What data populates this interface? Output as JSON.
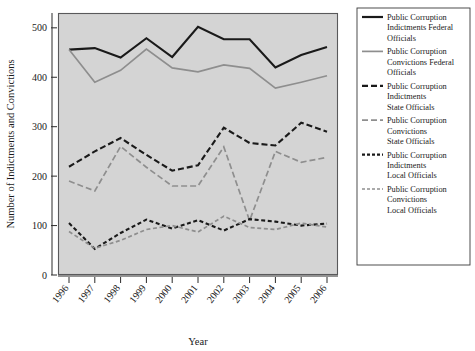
{
  "chart_data": {
    "type": "line",
    "title": "",
    "xlabel": "Year",
    "ylabel": "Number of Indictments and Convictions",
    "x": [
      1996,
      1997,
      1998,
      1999,
      2000,
      2001,
      2002,
      2003,
      2004,
      2005,
      2006
    ],
    "categories": [
      "1996",
      "1997",
      "1998",
      "1999",
      "2000",
      "2001",
      "2002",
      "2003",
      "2004",
      "2005",
      "2006"
    ],
    "xtick_labels": [
      "1996",
      "1997",
      "1998",
      "1999",
      "2000",
      "2001",
      "2002",
      "2003",
      "2004",
      "2005",
      "2006"
    ],
    "ytick_labels": [
      "0",
      "100",
      "200",
      "300",
      "400",
      "500"
    ],
    "yticks": [
      0,
      100,
      200,
      300,
      400,
      500
    ],
    "ylim": [
      0,
      530
    ],
    "xlim": [
      1995.6,
      2006.4
    ],
    "grid": false,
    "legend_position": "right",
    "plot_background": "#d4d4d4",
    "series": [
      {
        "name": "Public Corruption Indictments Federal Officials",
        "style": "solid",
        "color": "#1a1a1a",
        "width": 2.1,
        "dash": "none",
        "values": [
          456,
          459,
          440,
          479,
          441,
          502,
          477,
          477,
          420,
          445,
          461
        ]
      },
      {
        "name": "Public Corruption Convictions Federal Officials",
        "style": "solid",
        "color": "#8e8e8e",
        "width": 1.7,
        "dash": "none",
        "values": [
          456,
          390,
          414,
          457,
          419,
          411,
          425,
          418,
          378,
          390,
          403
        ]
      },
      {
        "name": "Public Corruption Indictments State Officials",
        "style": "dashed",
        "color": "#1a1a1a",
        "width": 2.1,
        "dash": "6,3",
        "values": [
          219,
          250,
          277,
          243,
          211,
          222,
          298,
          267,
          262,
          308,
          290
        ]
      },
      {
        "name": "Public Corruption Convictions State Officials",
        "style": "dashed",
        "color": "#8e8e8e",
        "width": 1.7,
        "dash": "6,3",
        "values": [
          190,
          170,
          260,
          218,
          180,
          180,
          259,
          110,
          250,
          228,
          238
        ]
      },
      {
        "name": "Public Corruption Indictments Local Officials",
        "style": "fine-dashed",
        "color": "#1a1a1a",
        "width": 2.1,
        "dash": "4,2.6",
        "values": [
          105,
          53,
          85,
          112,
          94,
          111,
          90,
          113,
          108,
          100,
          104
        ]
      },
      {
        "name": "Public Corruption Convictions Local Officials",
        "style": "fine-dashed",
        "color": "#8e8e8e",
        "width": 1.7,
        "dash": "4,2.6",
        "values": [
          88,
          54,
          70,
          92,
          100,
          87,
          119,
          96,
          92,
          105,
          97
        ]
      }
    ]
  },
  "legend": {
    "items": [
      {
        "label_lines": [
          "Public Corruption",
          "Indictments Federal",
          "Officials"
        ],
        "color": "#1a1a1a",
        "dash": "none",
        "width": 2.2
      },
      {
        "label_lines": [
          "Public Corruption",
          "Convictions Federal",
          "Officials"
        ],
        "color": "#8e8e8e",
        "dash": "none",
        "width": 1.7
      },
      {
        "label_lines": [
          "Public Corruption",
          "Indictments",
          "State Officials"
        ],
        "color": "#1a1a1a",
        "dash": "6,3",
        "width": 2.2
      },
      {
        "label_lines": [
          "Public Corruption",
          "Convictions",
          "State Officials"
        ],
        "color": "#8e8e8e",
        "dash": "6,3",
        "width": 1.7
      },
      {
        "label_lines": [
          "Public Corruption",
          "Indictments",
          "Local Officials"
        ],
        "color": "#1a1a1a",
        "dash": "3,2",
        "width": 2.2
      },
      {
        "label_lines": [
          "Public Corruption",
          "Convictions",
          "Local Officials"
        ],
        "color": "#8e8e8e",
        "dash": "3,2",
        "width": 1.7
      }
    ]
  }
}
